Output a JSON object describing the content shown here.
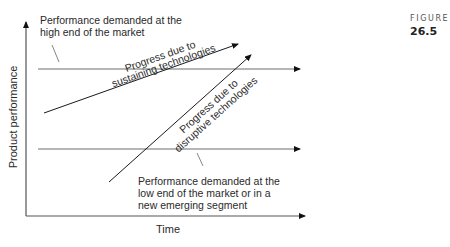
{
  "figure": {
    "label": "FIGURE",
    "number": "26.5"
  },
  "diagram": {
    "y_axis_label": "Product performance",
    "x_axis_label": "Time",
    "high_end_callout": {
      "line1": "Performance demanded at the",
      "line2": "high end of the market"
    },
    "low_end_callout": {
      "line1": "Performance demanded at the",
      "line2": "low end of the market or in a",
      "line3": "new emerging segment"
    },
    "sustaining_label": {
      "line1": "Progress due to",
      "line2": "sustaining technologies"
    },
    "disruptive_label": {
      "line1": "Progress due to",
      "line2": "disruptive technologies"
    },
    "colors": {
      "axis": "#555555",
      "market_lines": "#6e6e6e",
      "trajectory": "#1a1a1a",
      "text": "#2a2a2a"
    }
  }
}
